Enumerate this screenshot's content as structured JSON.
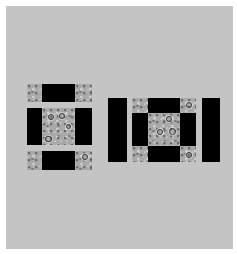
{
  "figure": {
    "background_color": "#ffffff",
    "panel_color": "#c4c4c4",
    "black_color": "#000000",
    "texture_color": "#a9a9a9"
  },
  "left_arrangement": {
    "layout": "3x3 grid",
    "rows": [
      [
        "texture",
        "black",
        "texture"
      ],
      [
        "black",
        "texture",
        "black"
      ],
      [
        "texture",
        "black",
        "texture"
      ]
    ]
  },
  "right_arrangement": {
    "layout": "black bar + 3x3 grid + black bar",
    "left_bar": "black",
    "rows": [
      [
        "texture",
        "black",
        "texture"
      ],
      [
        "black",
        "texture",
        "black"
      ],
      [
        "texture",
        "black",
        "texture"
      ]
    ],
    "right_bar": "black"
  }
}
